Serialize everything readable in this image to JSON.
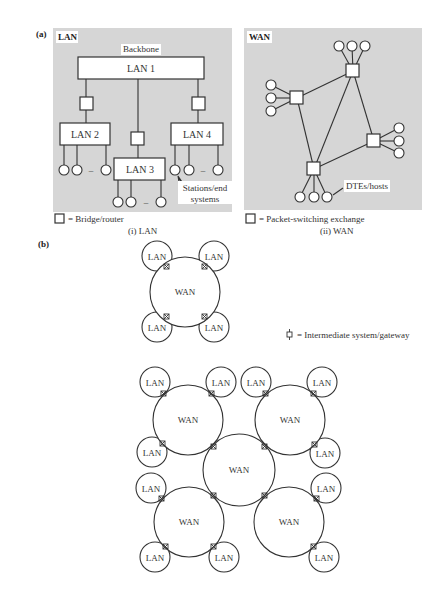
{
  "figure": {
    "part_a_label": "(a)",
    "part_b_label": "(b)",
    "lan_panel": {
      "title": "LAN",
      "backbone_label": "Backbone",
      "networks": [
        "LAN 1",
        "LAN 2",
        "LAN 3",
        "LAN 4"
      ],
      "stations_label_line1": "Stations/end",
      "stations_label_line2": "systems",
      "dash": "–",
      "legend": "= Bridge/router",
      "caption": "(i)  LAN"
    },
    "wan_panel": {
      "title": "WAN",
      "hosts_label": "DTEs/hosts",
      "legend": "= Packet-switching exchange",
      "caption": "(ii)  WAN"
    },
    "internetwork": {
      "gateway_legend": "= Intermediate system/gateway",
      "wan_label": "WAN",
      "lan_label": "LAN",
      "small_diagram": {
        "wan": {
          "cx": 185,
          "cy": 292,
          "r": 35
        },
        "lans": [
          {
            "cx": 157,
            "cy": 256
          },
          {
            "cx": 214,
            "cy": 256
          },
          {
            "cx": 157,
            "cy": 327
          },
          {
            "cx": 214,
            "cy": 327
          }
        ]
      },
      "large_diagram": {
        "wans": [
          {
            "cx": 188,
            "cy": 420
          },
          {
            "cx": 290,
            "cy": 420
          },
          {
            "cx": 239,
            "cy": 470
          },
          {
            "cx": 189,
            "cy": 522
          },
          {
            "cx": 289,
            "cy": 522
          }
        ],
        "lans": [
          {
            "cx": 155,
            "cy": 382
          },
          {
            "cx": 221,
            "cy": 382
          },
          {
            "cx": 256,
            "cy": 382
          },
          {
            "cx": 322,
            "cy": 382
          },
          {
            "cx": 152,
            "cy": 452
          },
          {
            "cx": 325,
            "cy": 453
          },
          {
            "cx": 151,
            "cy": 488
          },
          {
            "cx": 326,
            "cy": 488
          },
          {
            "cx": 155,
            "cy": 557
          },
          {
            "cx": 224,
            "cy": 557
          },
          {
            "cx": 324,
            "cy": 557
          }
        ]
      }
    }
  }
}
